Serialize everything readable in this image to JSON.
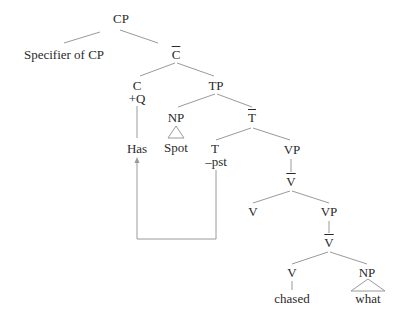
{
  "tree": {
    "nodes": {
      "cp": "CP",
      "specifier": "Specifier of CP",
      "c_bar": "C",
      "c": "C",
      "c_feature": "+Q",
      "has": "Has",
      "tp": "TP",
      "np_subject": "NP",
      "spot": "Spot",
      "t_bar": "T",
      "t": "T",
      "t_feature": "–pst",
      "vp_upper": "VP",
      "v_bar_upper": "V",
      "v_upper": "V",
      "vp_lower": "VP",
      "v_bar_lower": "V",
      "v_lower": "V",
      "chased": "chased",
      "np_object": "NP",
      "what": "what"
    },
    "movement": {
      "from": "T",
      "to": "Has",
      "description": "T-to-C movement arrow"
    },
    "colors": {
      "text": "#2a2a2a",
      "line": "#9a9a9a"
    }
  }
}
